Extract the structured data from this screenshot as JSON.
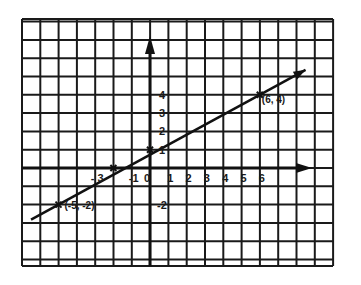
{
  "chart_data": {
    "type": "line",
    "title": "",
    "xlabel": "",
    "ylabel": "",
    "grid": true,
    "xlim": [
      -7,
      10
    ],
    "ylim": [
      -5,
      8
    ],
    "x_tick_labels": [
      {
        "value": -3,
        "label": "- 3"
      },
      {
        "value": -1,
        "label": "-1"
      },
      {
        "value": 0,
        "label": "0"
      },
      {
        "value": 1,
        "label": "1"
      },
      {
        "value": 2,
        "label": "2"
      },
      {
        "value": 3,
        "label": "3"
      },
      {
        "value": 4,
        "label": "4"
      },
      {
        "value": 5,
        "label": "5"
      },
      {
        "value": 6,
        "label": "6"
      }
    ],
    "y_tick_labels": [
      {
        "value": 4,
        "label": "4"
      },
      {
        "value": 3,
        "label": "3"
      },
      {
        "value": 2,
        "label": "2"
      },
      {
        "value": 1,
        "label": "1"
      },
      {
        "value": -2,
        "label": "-2"
      }
    ],
    "series": [
      {
        "name": "line",
        "points": [
          {
            "x": -5,
            "y": -2,
            "label": "(-5, -2)"
          },
          {
            "x": -2,
            "y": 0,
            "label": ""
          },
          {
            "x": 0,
            "y": 1,
            "label": ""
          },
          {
            "x": 6,
            "y": 4,
            "label": "(6, 4)"
          }
        ],
        "extends": [
          -6.5,
          8.5
        ]
      }
    ],
    "annotations": [
      "(6,4)",
      "(-5, -2)"
    ]
  }
}
